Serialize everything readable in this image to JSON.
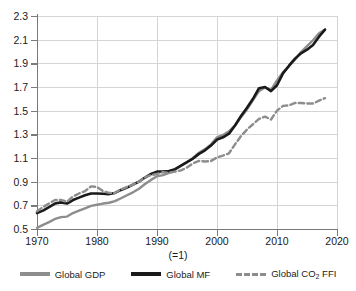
{
  "chart_data": {
    "type": "line",
    "title": "",
    "xlabel": "(=1)",
    "ylabel": "",
    "xlim": [
      1970,
      2020
    ],
    "ylim": [
      0.5,
      2.3
    ],
    "grid": true,
    "legend_position": "bottom",
    "note": "(=1)",
    "x_ticks": [
      "1970",
      "1980",
      "1990",
      "2000",
      "2010",
      "2020"
    ],
    "y_ticks": [
      "0.5",
      "0.7",
      "0.9",
      "1.1",
      "1.3",
      "1.5",
      "1.7",
      "1.9",
      "2.1",
      "2.3"
    ],
    "x": [
      1970,
      1971,
      1972,
      1973,
      1974,
      1975,
      1976,
      1977,
      1978,
      1979,
      1980,
      1981,
      1982,
      1983,
      1984,
      1985,
      1986,
      1987,
      1988,
      1989,
      1990,
      1991,
      1992,
      1993,
      1994,
      1995,
      1996,
      1997,
      1998,
      1999,
      2000,
      2001,
      2002,
      2003,
      2004,
      2005,
      2006,
      2007,
      2008,
      2009,
      2010,
      2011,
      2012,
      2013,
      2014,
      2015,
      2016,
      2017,
      2018
    ],
    "series": [
      {
        "name": "Global GDP",
        "color": "#8d8d8d",
        "style": "solid",
        "values": [
          0.51,
          0.535,
          0.558,
          0.585,
          0.6,
          0.605,
          0.635,
          0.655,
          0.675,
          0.695,
          0.705,
          0.715,
          0.722,
          0.735,
          0.76,
          0.785,
          0.81,
          0.84,
          0.88,
          0.915,
          0.945,
          0.955,
          0.975,
          1.0,
          1.035,
          1.065,
          1.1,
          1.145,
          1.175,
          1.215,
          1.275,
          1.295,
          1.325,
          1.375,
          1.445,
          1.51,
          1.59,
          1.665,
          1.695,
          1.675,
          1.755,
          1.825,
          1.875,
          1.93,
          1.995,
          2.045,
          2.095,
          2.155,
          2.185
        ]
      },
      {
        "name": "Global MF",
        "color": "#1a1a1a",
        "style": "solid",
        "values": [
          0.635,
          0.655,
          0.685,
          0.715,
          0.725,
          0.715,
          0.745,
          0.765,
          0.785,
          0.8,
          0.8,
          0.798,
          0.795,
          0.805,
          0.83,
          0.85,
          0.875,
          0.9,
          0.935,
          0.965,
          0.985,
          0.985,
          0.99,
          1.005,
          1.035,
          1.065,
          1.095,
          1.135,
          1.165,
          1.205,
          1.255,
          1.275,
          1.305,
          1.375,
          1.455,
          1.525,
          1.6,
          1.69,
          1.7,
          1.665,
          1.715,
          1.815,
          1.88,
          1.94,
          1.985,
          2.015,
          2.055,
          2.125,
          2.185
        ]
      },
      {
        "name": "Global CO2 FFI",
        "label_html": "Global CO<sub>2</sub> FFI",
        "color": "#8d8d8d",
        "style": "dashed",
        "values": [
          0.65,
          0.685,
          0.715,
          0.745,
          0.745,
          0.73,
          0.775,
          0.8,
          0.82,
          0.86,
          0.855,
          0.82,
          0.805,
          0.805,
          0.835,
          0.855,
          0.875,
          0.9,
          0.935,
          0.955,
          0.965,
          0.98,
          0.975,
          0.985,
          0.995,
          1.02,
          1.055,
          1.075,
          1.07,
          1.075,
          1.105,
          1.12,
          1.14,
          1.215,
          1.285,
          1.34,
          1.385,
          1.43,
          1.45,
          1.425,
          1.5,
          1.54,
          1.545,
          1.565,
          1.565,
          1.56,
          1.56,
          1.585,
          1.605
        ]
      }
    ]
  },
  "legend": {
    "items": [
      {
        "label": "Global GDP"
      },
      {
        "label": "Global MF"
      },
      {
        "label": "Global CO2 FFI"
      }
    ]
  }
}
